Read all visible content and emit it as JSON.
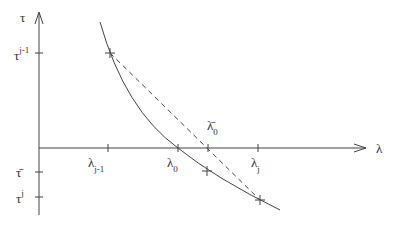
{
  "diagram": {
    "axes": {
      "y_label": "τ",
      "x_label": "λ"
    },
    "y_ticks": [
      {
        "base": "τ",
        "sup": "j-1",
        "y": 53
      },
      {
        "base": "τ̄",
        "sup": "",
        "y": 172
      },
      {
        "base": "τ",
        "sup": "j",
        "y": 197
      }
    ],
    "x_ticks": [
      {
        "base": "λ",
        "sub": "j-1",
        "x": 108
      },
      {
        "base": "λ",
        "sub": "0",
        "x": 178
      },
      {
        "base": "λ̄",
        "sub": "0",
        "x": 208
      },
      {
        "base": "λ",
        "sub": "j",
        "x": 258
      }
    ],
    "curve": "decreasing convex curve",
    "secant": "dashed line between (λ_{j-1}, τ^{j-1}) and (λ_j, τ^j)",
    "colors": {
      "stroke": "#444444",
      "background": "#ffffff"
    }
  }
}
